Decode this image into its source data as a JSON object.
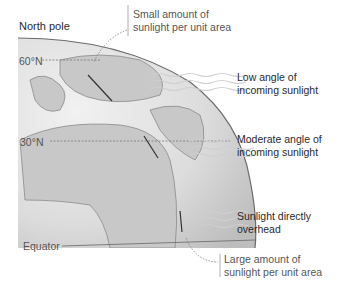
{
  "diagram": {
    "type": "illustration",
    "labels": {
      "north_pole": "North pole",
      "lat_60": "60°N",
      "lat_30": "30°N",
      "equator": "Equator",
      "small_amount_line1": "Small amount of",
      "small_amount_line2": "sunlight per unit area",
      "low_angle_line1": "Low angle of",
      "low_angle_line2": "incoming sunlight",
      "moderate_angle_line1": "Moderate angle of",
      "moderate_angle_line2": "incoming sunlight",
      "direct_line1": "Sunlight directly",
      "direct_line2": "overhead",
      "large_amount_line1": "Large amount of",
      "large_amount_line2": "sunlight per unit area"
    },
    "colors": {
      "globe_fill": "#d9d9d9",
      "land": "#c4c4c4",
      "rim": "#6a6a6a",
      "sun_rays": "#d0d0d0",
      "latitude_lines": "#777777"
    }
  }
}
